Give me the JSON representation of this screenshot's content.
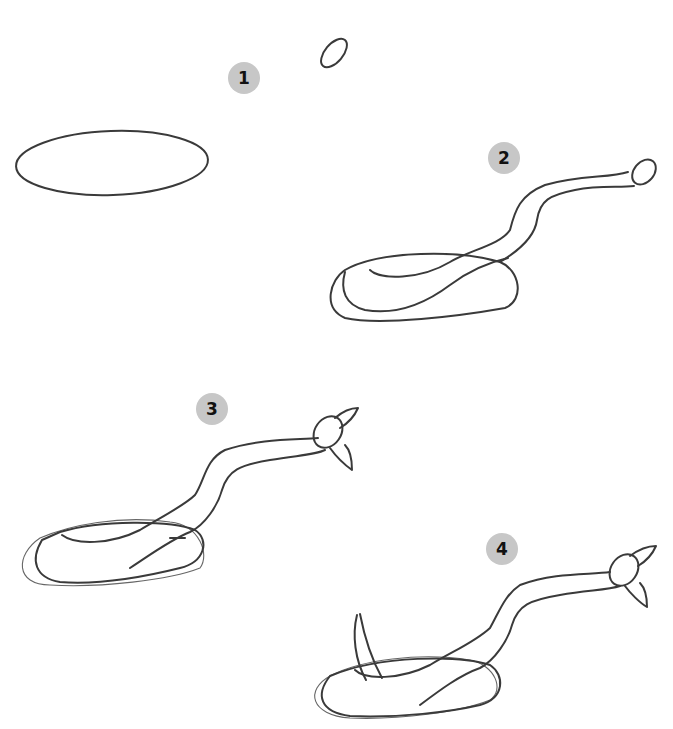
{
  "steps": [
    {
      "number": "1",
      "description": "Draw a flat oval body base and a small oval head"
    },
    {
      "number": "2",
      "description": "Connect with a curving neck coiled over the base"
    },
    {
      "number": "3",
      "description": "Add the head shape and hood"
    },
    {
      "number": "4",
      "description": "Add the raised tail"
    }
  ],
  "colors": {
    "badge": "#c7c7c7",
    "stroke": "#3a3a3a",
    "background": "#ffffff"
  }
}
